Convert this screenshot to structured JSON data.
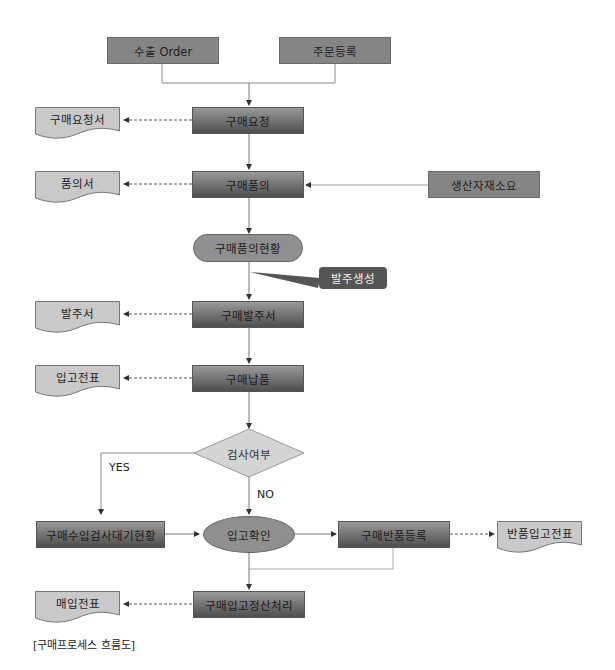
{
  "diagram": {
    "caption": "[구매프로세스 흐름도]",
    "sources": {
      "export_order": "수출 Order",
      "order_registration": "주문등록",
      "production_material": "생산자재소요"
    },
    "process": {
      "purchase_request": "구매요청",
      "purchase_approval": "구매품의",
      "approval_status": "구매품의현황",
      "purchase_order": "구매발주서",
      "purchase_delivery": "구매납품",
      "inspection_decision": "검사여부",
      "inspection_waiting": "구매수입검사대기현황",
      "receipt_confirm": "입고확인",
      "purchase_return": "구매반품등록",
      "settlement": "구매입고정산처리"
    },
    "documents": {
      "request_doc": "구매요청서",
      "approval_doc": "품의서",
      "order_doc": "발주서",
      "receipt_slip": "입고전표",
      "return_slip": "반품입고전표",
      "purchase_slip": "매입전표"
    },
    "callout": "발주생성",
    "branch_labels": {
      "yes": "YES",
      "no": "NO"
    }
  }
}
